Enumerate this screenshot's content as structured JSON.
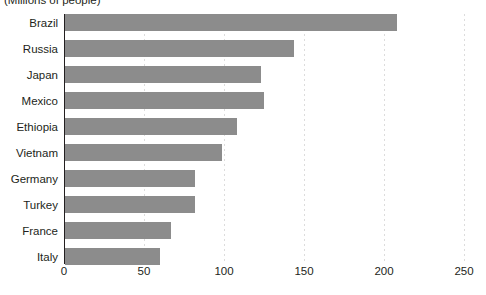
{
  "chart_data": {
    "type": "bar",
    "orientation": "horizontal",
    "title": "",
    "subtitle": "(Millions of people)",
    "xlabel": "",
    "ylabel": "",
    "xlim": [
      0,
      250
    ],
    "xticks": [
      0,
      50,
      100,
      150,
      200,
      250
    ],
    "grid": true,
    "legend": false,
    "bar_color": "#8c8c8c",
    "categories": [
      "Brazil",
      "Russia",
      "Japan",
      "Mexico",
      "Ethiopia",
      "Vietnam",
      "Germany",
      "Turkey",
      "France",
      "Italy"
    ],
    "values": [
      208,
      144,
      123,
      125,
      108,
      99,
      82,
      82,
      67,
      60
    ]
  }
}
